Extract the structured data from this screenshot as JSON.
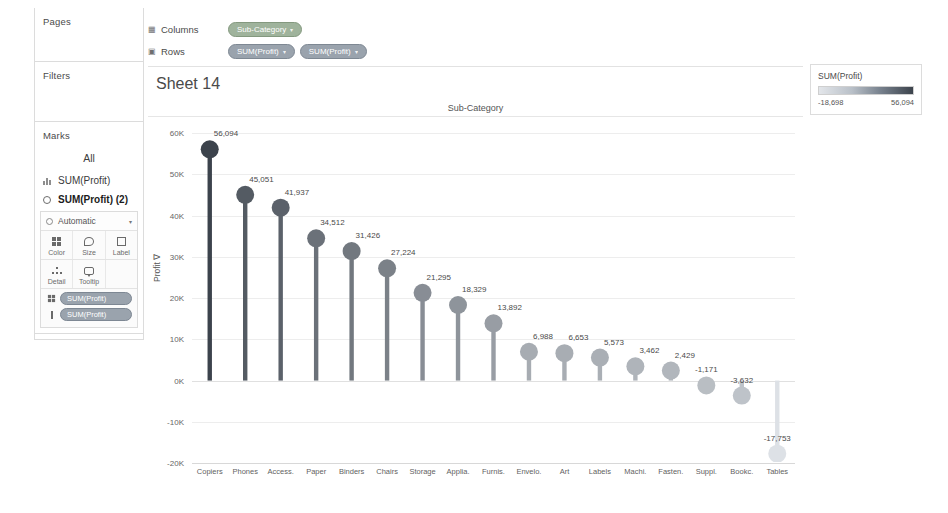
{
  "app": {
    "sheet_title": "Sheet 14"
  },
  "shelves": {
    "columns": {
      "label": "Columns",
      "icon": "columns-icon",
      "pills": [
        {
          "text": "Sub-Category",
          "caret": "▾",
          "color": "green"
        }
      ]
    },
    "rows": {
      "label": "Rows",
      "icon": "rows-icon",
      "pills": [
        {
          "text": "SUM(Profit)",
          "caret": "▾",
          "color": "blue"
        },
        {
          "text": "SUM(Profit)",
          "caret": "▾",
          "color": "blue"
        }
      ]
    }
  },
  "left_panel": {
    "pages": {
      "title": "Pages"
    },
    "filters": {
      "title": "Filters"
    },
    "marks": {
      "title": "Marks",
      "all_label": "All",
      "layers": [
        {
          "label": "SUM(Profit)",
          "icon": "bar-chart-icon",
          "active": false
        },
        {
          "label": "SUM(Profit) (2)",
          "icon": "circle-icon",
          "active": true
        }
      ],
      "mark_type": "Automatic",
      "mark_type_caret": "▾",
      "buttons": [
        {
          "label": "Color",
          "icon": "color-palette-icon"
        },
        {
          "label": "Size",
          "icon": "size-icon"
        },
        {
          "label": "Label",
          "icon": "label-icon"
        },
        {
          "label": "Detail",
          "icon": "detail-icon"
        },
        {
          "label": "Tooltip",
          "icon": "tooltip-icon"
        }
      ],
      "cards": [
        {
          "text": "SUM(Profit)",
          "caret": "▾",
          "slot": "color"
        },
        {
          "text": "SUM(Profit)",
          "caret": "▾",
          "slot": "label"
        }
      ]
    }
  },
  "legend": {
    "title": "SUM(Profit)",
    "min_label": "-18,698",
    "max_label": "56,094",
    "ramp_from": "#e3e6ea",
    "ramp_to": "#3c434c"
  },
  "chart_data": {
    "type": "bar",
    "title": "Sheet 14",
    "column_header": "Sub-Category",
    "xlabel": "",
    "ylabel": "Profit ∇",
    "ylim": [
      -20000,
      62000
    ],
    "ytick_labels": [
      "60K",
      "50K",
      "40K",
      "30K",
      "20K",
      "10K",
      "0K",
      "-10K",
      "-20K"
    ],
    "ytick_values": [
      60000,
      50000,
      40000,
      30000,
      20000,
      10000,
      0,
      -10000,
      -20000
    ],
    "grid": true,
    "legend_position": "right",
    "categories": [
      "Copiers",
      "Phones",
      "Access.",
      "Paper",
      "Binders",
      "Chairs",
      "Storage",
      "Applia.",
      "Furnis.",
      "Envelo.",
      "Art",
      "Labels",
      "Machi.",
      "Fasten.",
      "Suppl.",
      "Bookc.",
      "Tables"
    ],
    "values": [
      56094,
      45051,
      41937,
      34512,
      31426,
      27224,
      21295,
      18329,
      13892,
      6988,
      6653,
      5573,
      3462,
      2429,
      -1171,
      -3632,
      -17753
    ],
    "data_labels": [
      "56,094",
      "45,051",
      "41,937",
      "34,512",
      "31,426",
      "27,224",
      "21,295",
      "18,329",
      "13,892",
      "6,988",
      "6,653",
      "5,573",
      "3,462",
      "2,429",
      "-1,171",
      "-3,632",
      "-17,753"
    ]
  }
}
